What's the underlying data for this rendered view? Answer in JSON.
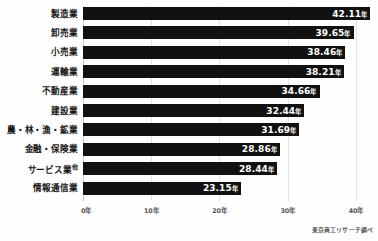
{
  "chart_data": {
    "type": "bar",
    "orientation": "horizontal",
    "title": "",
    "xlabel": "",
    "ylabel": "",
    "xlim": [
      0,
      42.11
    ],
    "axis_max_tick": 40,
    "unit": "年",
    "grid": true,
    "legend": false,
    "categories": [
      "製造業",
      "卸売業",
      "小売業",
      "運輸業",
      "不動産業",
      "建設業",
      "農・林・漁・鉱業",
      "金融・保険業",
      "サービス業",
      "情報通信業"
    ],
    "category_superscripts": [
      "",
      "",
      "",
      "",
      "",
      "",
      "",
      "",
      "他",
      ""
    ],
    "values": [
      42.11,
      39.65,
      38.46,
      38.21,
      34.66,
      32.44,
      31.69,
      28.86,
      28.44,
      23.15
    ],
    "value_labels": [
      "42.11",
      "39.65",
      "38.46",
      "38.21",
      "34.66",
      "32.44",
      "31.69",
      "28.86",
      "28.44",
      "23.15"
    ],
    "ticks": [
      {
        "value": 0,
        "label": "0年"
      },
      {
        "value": 10,
        "label": "10年"
      },
      {
        "value": 20,
        "label": "20年"
      },
      {
        "value": 30,
        "label": "30年"
      },
      {
        "value": 40,
        "label": "40年"
      }
    ],
    "colors": {
      "bar": "#111111",
      "value_text": "#ffffff",
      "category_text": "#1a1a1a",
      "gridline": "#e2e2e2",
      "background": "#fefefe"
    }
  },
  "source": {
    "text": "東京商工リサーチ調べ"
  }
}
